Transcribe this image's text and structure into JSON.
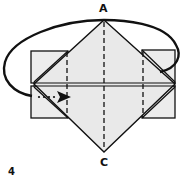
{
  "diagram": {
    "type": "origami-fold-step",
    "step_number": "4",
    "labels": {
      "top": "A",
      "bottom": "C"
    },
    "instruction_arrow": "rotate/turn-over arrow around top",
    "colors": {
      "paper": "#ececec",
      "line": "#111111",
      "background": "#ffffff"
    }
  }
}
